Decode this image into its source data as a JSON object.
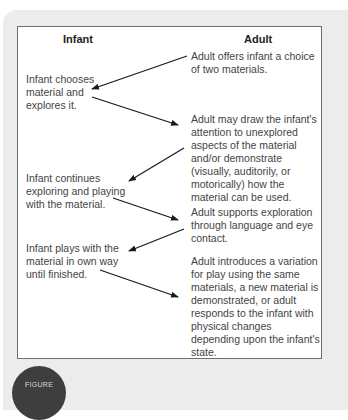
{
  "figure": {
    "columns": {
      "left": "Infant",
      "right": "Adult"
    },
    "infant_steps": [
      "Infant chooses material and explores it.",
      "Infant continues exploring and playing with the material.",
      "Infant plays with the material in own way until finished."
    ],
    "adult_steps": [
      "Adult offers infant a choice of two materials.",
      "Adult may draw the infant's attention to unexplored aspects of the material and/or demonstrate (visually, auditorily, or motorically) how the material can be used.",
      "Adult supports exploration through language and eye contact.",
      "Adult introduces a variation for play using the same materials, a new material is demonstrated, or adult responds to the infant with physical changes depending upon the infant's state."
    ],
    "arrows": [
      {
        "from": "adult_steps.0",
        "to": "infant_steps.0"
      },
      {
        "from": "infant_steps.0",
        "to": "adult_steps.1"
      },
      {
        "from": "adult_steps.1",
        "to": "infant_steps.1"
      },
      {
        "from": "infant_steps.1",
        "to": "adult_steps.2"
      },
      {
        "from": "adult_steps.2",
        "to": "infant_steps.2"
      },
      {
        "from": "infant_steps.2",
        "to": "adult_steps.3"
      }
    ],
    "badge_label": "FIGURE"
  },
  "colors": {
    "panel": "#ececec",
    "border": "#6e6e6e",
    "text": "#444444",
    "badge": "#3e3e3e"
  }
}
